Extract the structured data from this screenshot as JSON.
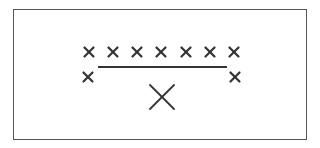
{
  "diagram": {
    "colors": {
      "stroke": "#333333",
      "border": "#555555",
      "background": "#ffffff"
    },
    "top_row_marks": [
      {
        "x": 89,
        "y": 52
      },
      {
        "x": 113,
        "y": 52
      },
      {
        "x": 137,
        "y": 52
      },
      {
        "x": 161,
        "y": 52
      },
      {
        "x": 186,
        "y": 52
      },
      {
        "x": 210,
        "y": 52
      },
      {
        "x": 234,
        "y": 52
      }
    ],
    "side_marks": [
      {
        "x": 88,
        "y": 77
      },
      {
        "x": 235,
        "y": 77
      }
    ],
    "line": {
      "x1": 98,
      "y1": 67,
      "x2": 227,
      "y2": 67
    },
    "large_mark": {
      "x": 162,
      "y": 97,
      "size": 24
    }
  }
}
